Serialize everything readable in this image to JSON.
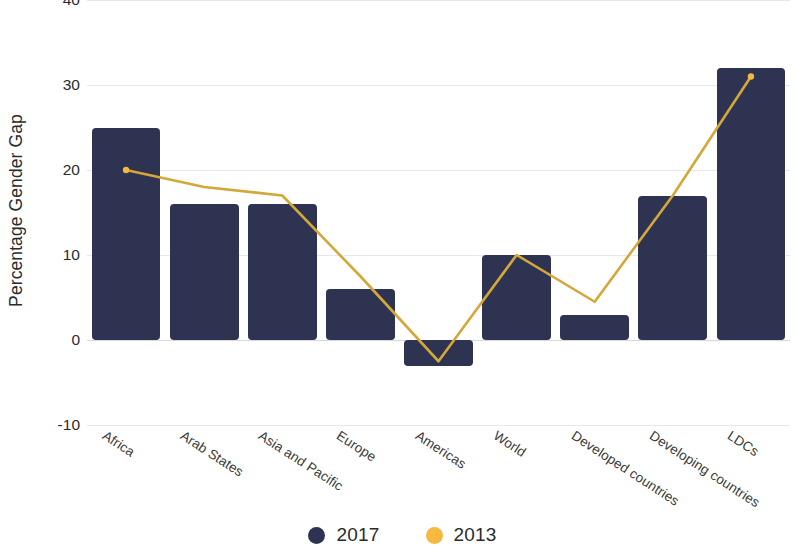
{
  "chart_data": {
    "type": "bar",
    "title": "",
    "subtitle": "",
    "xlabel": "",
    "ylabel": "Percentage Gender Gap",
    "ylim": [
      -10,
      40
    ],
    "yticks": [
      40,
      30,
      20,
      10,
      0,
      -10
    ],
    "ytick_labels": [
      "40",
      "30",
      "20",
      "10",
      "0",
      "-10"
    ],
    "grid": true,
    "legend_position": "bottom-center",
    "categories": [
      "Africa",
      "Arab States",
      "Asia and Pacific",
      "Europe",
      "Americas",
      "World",
      "Developed countries",
      "Developing countries",
      "LDCs"
    ],
    "series": [
      {
        "name": "2017",
        "type": "bar",
        "color": "#2e3352",
        "values": [
          25,
          16,
          16,
          6,
          -3,
          10,
          3,
          17,
          32
        ]
      },
      {
        "name": "2013",
        "type": "line",
        "color": "#d4a838",
        "marker_color": "#f5b942",
        "values": [
          20,
          18,
          17,
          7.5,
          -2.5,
          10,
          4.5,
          17,
          31
        ]
      }
    ]
  },
  "legend": {
    "items": [
      {
        "label": "2017",
        "color": "#2e3352",
        "marker": "circle"
      },
      {
        "label": "2013",
        "color": "#f5b942",
        "marker": "circle"
      }
    ]
  }
}
